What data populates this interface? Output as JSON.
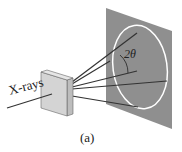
{
  "diagram": {
    "incident_label": "X-rays",
    "angle_label": "2θ",
    "caption": "(a)",
    "colors": {
      "screen": "#8f8f8f",
      "ring": "#ffffff",
      "crystal_face": "#d4d4d4",
      "crystal_side": "#bdbdbd",
      "rays": "#333333"
    }
  }
}
